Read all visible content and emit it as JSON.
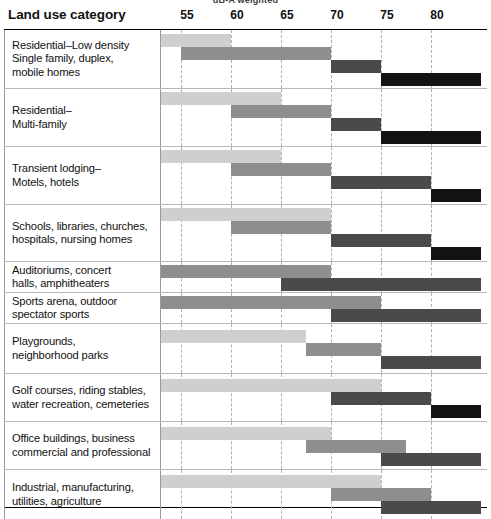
{
  "top_caption": "dB-A weighted",
  "header": {
    "title": "Land use category",
    "ticks": [
      {
        "label": "55",
        "value": 55
      },
      {
        "label": "60",
        "value": 60
      },
      {
        "label": "65",
        "value": 65
      },
      {
        "label": "70",
        "value": 70
      },
      {
        "label": "75",
        "value": 75
      },
      {
        "label": "80",
        "value": 80
      }
    ]
  },
  "colors": {
    "band_1": "#cfcfcf",
    "band_2": "#8e8e8e",
    "band_3": "#4a4a4a",
    "band_4": "#121212",
    "gridline": "#b0b0b0",
    "row_divider": "#b9b9b9",
    "frame": "#000000"
  },
  "chart_data": {
    "type": "bar",
    "xlabel": "dB-A weighted",
    "ylabel": "Land use category",
    "xlim": [
      52.5,
      85
    ],
    "grid": true,
    "legend": null,
    "axis_ticks": [
      55,
      60,
      65,
      70,
      75,
      80
    ],
    "series": [
      {
        "name": "band_1",
        "color": "#cfcfcf"
      },
      {
        "name": "band_2",
        "color": "#8e8e8e"
      },
      {
        "name": "band_3",
        "color": "#4a4a4a"
      },
      {
        "name": "band_4",
        "color": "#121212"
      }
    ],
    "categories": [
      "Residential–Low density Single family, duplex, mobile homes",
      "Residential– Multi-family",
      "Transient lodging– Motels, hotels",
      "Schools, libraries, churches, hospitals, nursing homes",
      "Auditoriums, concert halls, amphitheaters",
      "Sports arena, outdoor spectator sports",
      "Playgrounds, neighborhood parks",
      "Golf courses, riding stables, water recreation, cemeteries",
      "Office buildings, business commercial and professional",
      "Industrial, manufacturing, utilities, agriculture"
    ],
    "rows": [
      {
        "category_lines": [
          "Residential–Low density",
          "Single family, duplex,",
          "mobile homes"
        ],
        "height": 59,
        "bars": [
          {
            "band": "band_1",
            "start": 52.5,
            "end": 60.0,
            "track": 0
          },
          {
            "band": "band_2",
            "start": 55.0,
            "end": 70.0,
            "track": 1
          },
          {
            "band": "band_3",
            "start": 70.0,
            "end": 75.0,
            "track": 2
          },
          {
            "band": "band_4",
            "start": 75.0,
            "end": 85.0,
            "track": 3
          }
        ]
      },
      {
        "category_lines": [
          "Residential–",
          "Multi-family"
        ],
        "height": 58,
        "bars": [
          {
            "band": "band_1",
            "start": 52.5,
            "end": 65.0,
            "track": 0
          },
          {
            "band": "band_2",
            "start": 60.0,
            "end": 70.0,
            "track": 1
          },
          {
            "band": "band_3",
            "start": 70.0,
            "end": 75.0,
            "track": 2
          },
          {
            "band": "band_4",
            "start": 75.0,
            "end": 85.0,
            "track": 3
          }
        ]
      },
      {
        "category_lines": [
          "Transient lodging–",
          "Motels, hotels"
        ],
        "height": 58,
        "bars": [
          {
            "band": "band_1",
            "start": 52.5,
            "end": 65.0,
            "track": 0
          },
          {
            "band": "band_2",
            "start": 60.0,
            "end": 70.0,
            "track": 1
          },
          {
            "band": "band_3",
            "start": 70.0,
            "end": 80.0,
            "track": 2
          },
          {
            "band": "band_4",
            "start": 80.0,
            "end": 85.0,
            "track": 3
          }
        ]
      },
      {
        "category_lines": [
          "Schools, libraries, churches,",
          "hospitals, nursing homes"
        ],
        "height": 57,
        "bars": [
          {
            "band": "band_1",
            "start": 52.5,
            "end": 70.0,
            "track": 0
          },
          {
            "band": "band_2",
            "start": 60.0,
            "end": 70.0,
            "track": 1
          },
          {
            "band": "band_3",
            "start": 70.0,
            "end": 80.0,
            "track": 2
          },
          {
            "band": "band_4",
            "start": 80.0,
            "end": 85.0,
            "track": 3
          }
        ]
      },
      {
        "category_lines": [
          "Auditoriums, concert",
          "halls, amphitheaters"
        ],
        "height": 31,
        "bars": [
          {
            "band": "band_2",
            "start": 52.5,
            "end": 70.0,
            "track": 0
          },
          {
            "band": "band_3",
            "start": 65.0,
            "end": 85.0,
            "track": 1
          }
        ]
      },
      {
        "category_lines": [
          "Sports arena, outdoor",
          "spectator sports"
        ],
        "height": 31,
        "bars": [
          {
            "band": "band_2",
            "start": 52.5,
            "end": 75.0,
            "track": 0
          },
          {
            "band": "band_3",
            "start": 70.0,
            "end": 85.0,
            "track": 1
          }
        ]
      },
      {
        "category_lines": [
          "Playgrounds,",
          "neighborhood parks"
        ],
        "height": 50,
        "bars": [
          {
            "band": "band_1",
            "start": 52.5,
            "end": 67.5,
            "track": 0
          },
          {
            "band": "band_2",
            "start": 67.5,
            "end": 75.0,
            "track": 1
          },
          {
            "band": "band_3",
            "start": 75.0,
            "end": 85.0,
            "track": 2
          }
        ]
      },
      {
        "category_lines": [
          "Golf courses, riding stables,",
          "water recreation, cemeteries"
        ],
        "height": 48,
        "bars": [
          {
            "band": "band_1",
            "start": 52.5,
            "end": 75.0,
            "track": 0
          },
          {
            "band": "band_3",
            "start": 70.0,
            "end": 80.0,
            "track": 1
          },
          {
            "band": "band_4",
            "start": 80.0,
            "end": 85.0,
            "track": 2
          }
        ]
      },
      {
        "category_lines": [
          "Office buildings, business",
          "commercial and professional"
        ],
        "height": 48,
        "bars": [
          {
            "band": "band_1",
            "start": 52.5,
            "end": 70.0,
            "track": 0
          },
          {
            "band": "band_2",
            "start": 67.5,
            "end": 77.5,
            "track": 1
          },
          {
            "band": "band_3",
            "start": 75.0,
            "end": 85.0,
            "track": 2
          }
        ]
      },
      {
        "category_lines": [
          "Industrial, manufacturing,",
          "utilities, agriculture"
        ],
        "height": 49,
        "bars": [
          {
            "band": "band_1",
            "start": 52.5,
            "end": 75.0,
            "track": 0
          },
          {
            "band": "band_2",
            "start": 70.0,
            "end": 80.0,
            "track": 1
          },
          {
            "band": "band_3",
            "start": 75.0,
            "end": 85.0,
            "track": 2
          }
        ]
      }
    ]
  }
}
